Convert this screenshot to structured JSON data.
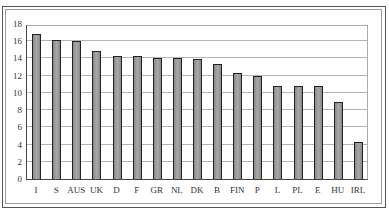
{
  "chart_data": {
    "type": "bar",
    "title": "",
    "xlabel": "",
    "ylabel": "",
    "ylim": [
      0,
      18
    ],
    "yticks": [
      0,
      2,
      4,
      6,
      8,
      10,
      12,
      14,
      16,
      18
    ],
    "grid": true,
    "legend": "none",
    "categories": [
      "I",
      "S",
      "AUS",
      "UK",
      "D",
      "F",
      "GR",
      "NL",
      "DK",
      "B",
      "FIN",
      "P",
      "L",
      "PL",
      "E",
      "HU",
      "IRL"
    ],
    "values": [
      16.8,
      16.2,
      16.0,
      14.9,
      14.3,
      14.3,
      14.1,
      14.1,
      13.9,
      13.4,
      12.3,
      12.0,
      10.8,
      10.8,
      10.8,
      9.0,
      4.3
    ],
    "bar_color": "#999999",
    "bar_edge_color": "#222222"
  }
}
